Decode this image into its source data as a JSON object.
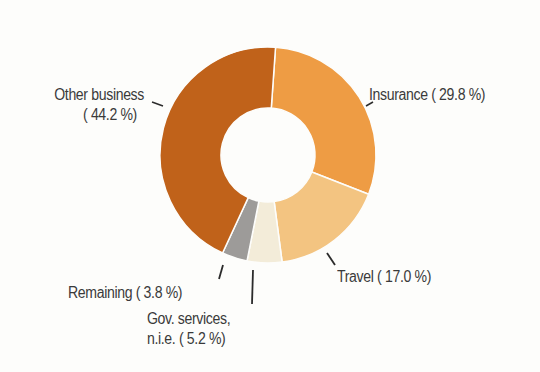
{
  "chart_data": {
    "type": "pie",
    "variant": "donut",
    "title": "",
    "categories": [
      "Insurance",
      "Travel",
      "Gov. services, n.i.e.",
      "Remaining",
      "Other business"
    ],
    "values": [
      29.8,
      17.0,
      5.2,
      3.8,
      44.2
    ],
    "unit": "%",
    "colors": [
      "#ee9c44",
      "#f3c481",
      "#f3ecd9",
      "#9d9b99",
      "#c0621a"
    ],
    "start_angle_deg": 4,
    "direction": "clockwise",
    "center": [
      268,
      155
    ],
    "outer_radius": 108,
    "inner_radius": 47,
    "legend": "none (direct labels with leader lines)"
  },
  "labels": {
    "insurance": {
      "line1": "Insurance ( 29.8 %)"
    },
    "travel": {
      "line1": "Travel ( 17.0 %)"
    },
    "gov_services": {
      "line1": "Gov. services,",
      "line2": "n.i.e. (  5.2 %)"
    },
    "remaining": {
      "line1": "Remaining (  3.8 %)"
    },
    "other_business": {
      "line1": "Other business",
      "line2": "( 44.2 %)"
    }
  },
  "style": {
    "separator_color": "#fdfdfb",
    "leader_color": "#2b2b2b",
    "text_color": "#3a3a3a"
  }
}
